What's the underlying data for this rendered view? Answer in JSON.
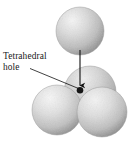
{
  "figure": {
    "name": "tetrahedral-hole-close-packing",
    "background_color": "#ffffff",
    "width": 132,
    "height": 145
  },
  "annotation": {
    "label_line_1": "Tetrahedral",
    "label_line_2": "hole",
    "full_text": "Tetrahedral hole",
    "text_color": "#1a1a1a",
    "leader_line": {
      "name": "leader-line",
      "color": "#111111",
      "from": [
        30,
        68
      ],
      "to": [
        78,
        88
      ]
    },
    "arrow": {
      "name": "pointer-arrow",
      "color": "#111111",
      "from": [
        80,
        50
      ],
      "to": [
        80,
        88
      ],
      "direction": "down"
    }
  },
  "hole_marker": {
    "name": "tetrahedral-hole-dot",
    "color": "#161616",
    "center": [
      80,
      90
    ],
    "radius": 3.2
  },
  "spheres": [
    {
      "name": "sphere-top",
      "role": "apex sphere",
      "cx": 80,
      "cy": 31,
      "r": 24,
      "base_color": "#c9c9c9",
      "highlight_color": "#f2f2f2",
      "shadow_color": "#8f8f8f"
    },
    {
      "name": "sphere-back",
      "role": "rear base sphere",
      "cx": 90,
      "cy": 92,
      "r": 26,
      "base_color": "#c4c4c4",
      "highlight_color": "#ececec",
      "shadow_color": "#868686"
    },
    {
      "name": "sphere-front-left",
      "role": "front-left base sphere",
      "cx": 57,
      "cy": 110,
      "r": 25,
      "base_color": "#cccccc",
      "highlight_color": "#f4f4f4",
      "shadow_color": "#8b8b8b"
    },
    {
      "name": "sphere-front-right",
      "role": "front-right base sphere",
      "cx": 102,
      "cy": 112,
      "r": 25,
      "base_color": "#cacaca",
      "highlight_color": "#f1f1f1",
      "shadow_color": "#878787"
    }
  ]
}
